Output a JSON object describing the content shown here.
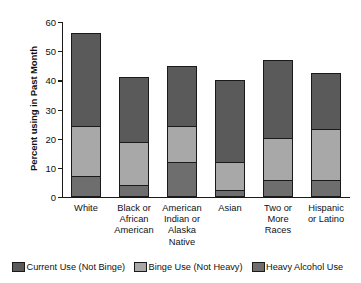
{
  "chart_data": {
    "type": "bar",
    "stacked": true,
    "title": "",
    "xlabel": "",
    "ylabel": "Percent using in Past Month",
    "ylim": [
      0,
      60
    ],
    "yticks": [
      0,
      10,
      20,
      30,
      40,
      50,
      60
    ],
    "ytick_labels": [
      "0",
      "10",
      "20",
      "30",
      "40",
      "50",
      "60"
    ],
    "grid": false,
    "legend_position": "bottom",
    "categories": [
      "White",
      "Black or African American",
      "American Indian or Alaska Native",
      "Asian",
      "Two or More Races",
      "Hispanic or Latino"
    ],
    "category_label_lines": [
      [
        "White"
      ],
      [
        "Black or",
        "African",
        "American"
      ],
      [
        "American",
        "Indian or",
        "Alaska",
        "Native"
      ],
      [
        "Asian"
      ],
      [
        "Two or",
        "More",
        "Races"
      ],
      [
        "Hispanic",
        "or Latino"
      ]
    ],
    "series": [
      {
        "name": "Heavy Alcohol Use",
        "color": "#6e6e6e",
        "values": [
          7.3,
          4.2,
          12.0,
          2.3,
          5.9,
          6.0
        ]
      },
      {
        "name": "Binge Use (Not Heavy)",
        "color": "#a8a8a8",
        "values": [
          17.2,
          14.6,
          12.2,
          9.7,
          14.2,
          17.2
        ]
      },
      {
        "name": "Current Use (Not Binge)",
        "color": "#5a5a5a",
        "values": [
          31.7,
          22.4,
          20.8,
          28.2,
          26.9,
          19.3
        ]
      }
    ],
    "stack_boundaries": {
      "heavy_top": [
        7.3,
        4.2,
        12.0,
        2.3,
        5.9,
        6.0
      ],
      "binge_top": [
        24.5,
        18.8,
        24.2,
        12.0,
        20.1,
        23.2
      ],
      "total": [
        56.2,
        41.2,
        45.0,
        40.2,
        47.0,
        42.5
      ]
    },
    "legend": [
      {
        "label": "Current Use (Not Binge)",
        "color": "#5a5a5a"
      },
      {
        "label": "Binge Use (Not Heavy)",
        "color": "#a8a8a8"
      },
      {
        "label": "Heavy Alcohol Use",
        "color": "#6e6e6e"
      }
    ]
  }
}
